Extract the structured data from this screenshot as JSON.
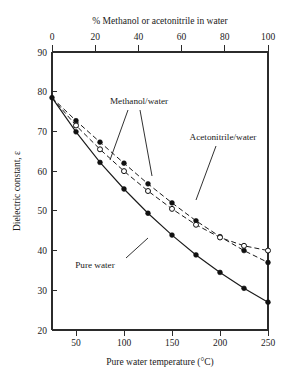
{
  "chart_data": {
    "type": "line",
    "title": "",
    "top_axis": {
      "label": "% Methanol or acetonitrile in water",
      "ticks": [
        0,
        20,
        40,
        60,
        80,
        100
      ],
      "range": [
        0,
        100
      ]
    },
    "xlabel": "Pure water temperature (°C)",
    "xticks": [
      50,
      100,
      150,
      200,
      250
    ],
    "xlim": [
      25,
      250
    ],
    "ylabel": "Dielectric constant, ε",
    "yticks": [
      20,
      30,
      40,
      50,
      60,
      70,
      80,
      90
    ],
    "ylim": [
      20,
      90
    ],
    "grid": false,
    "legend": "none",
    "annotations": [
      {
        "text": "Methanol/water",
        "id": "methanol-water-label"
      },
      {
        "text": "Acetonitrile/water",
        "id": "acetonitrile-water-label"
      },
      {
        "text": "Pure water",
        "id": "pure-water-label"
      }
    ],
    "series": [
      {
        "name": "Pure water",
        "marker": "filled-circle",
        "line": "solid",
        "x": [
          25,
          50,
          75,
          100,
          125,
          150,
          175,
          200,
          225,
          250
        ],
        "values": [
          78.5,
          69.9,
          62.2,
          55.5,
          49.4,
          43.9,
          38.9,
          34.5,
          30.5,
          27.0
        ]
      },
      {
        "name": "Methanol/water",
        "marker": "filled-circle",
        "line": "dashed",
        "x": [
          25,
          50,
          75,
          100,
          125,
          150,
          175,
          200,
          225,
          250
        ],
        "values": [
          78.5,
          72.7,
          67.3,
          62.0,
          56.8,
          52.0,
          47.5,
          43.5,
          40.0,
          37.0
        ]
      },
      {
        "name": "Acetonitrile/water",
        "marker": "open-circle",
        "line": "dashed",
        "x": [
          25,
          50,
          75,
          100,
          125,
          150,
          175,
          200,
          225,
          250
        ],
        "values": [
          78.5,
          71.5,
          65.5,
          60.0,
          55.0,
          50.5,
          46.5,
          43.3,
          41.2,
          40.0
        ]
      }
    ]
  }
}
